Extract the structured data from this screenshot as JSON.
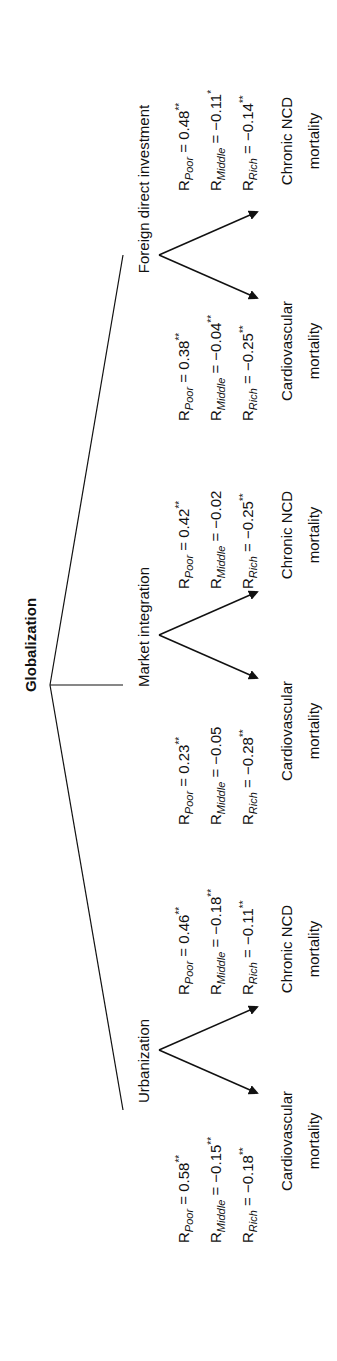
{
  "diagram": {
    "root": "Globalization",
    "branches": [
      {
        "label": "Urbanization",
        "outcomes": [
          {
            "label_line1": "Cardiovascular",
            "label_line2": "mortality",
            "r": [
              {
                "group": "Poor",
                "value": "0.58",
                "sig": "**"
              },
              {
                "group": "Middle",
                "value": "−0.15",
                "sig": "**"
              },
              {
                "group": "Rich",
                "value": "−0.18",
                "sig": "**"
              }
            ]
          },
          {
            "label_line1": "Chronic NCD",
            "label_line2": "mortality",
            "r": [
              {
                "group": "Poor",
                "value": "0.46",
                "sig": "**"
              },
              {
                "group": "Middle",
                "value": "−0.18",
                "sig": "**"
              },
              {
                "group": "Rich",
                "value": "−0.11",
                "sig": "**"
              }
            ]
          }
        ]
      },
      {
        "label": "Market integration",
        "outcomes": [
          {
            "label_line1": "Cardiovascular",
            "label_line2": "mortality",
            "r": [
              {
                "group": "Poor",
                "value": "0.23",
                "sig": "**"
              },
              {
                "group": "Middle",
                "value": "−0.05",
                "sig": ""
              },
              {
                "group": "Rich",
                "value": "−0.28",
                "sig": "**"
              }
            ]
          },
          {
            "label_line1": "Chronic NCD",
            "label_line2": "mortality",
            "r": [
              {
                "group": "Poor",
                "value": "0.42",
                "sig": "**"
              },
              {
                "group": "Middle",
                "value": "−0.02",
                "sig": ""
              },
              {
                "group": "Rich",
                "value": "−0.25",
                "sig": "**"
              }
            ]
          }
        ]
      },
      {
        "label": "Foreign direct investment",
        "outcomes": [
          {
            "label_line1": "Cardiovascular",
            "label_line2": "mortality",
            "r": [
              {
                "group": "Poor",
                "value": "0.38",
                "sig": "**"
              },
              {
                "group": "Middle",
                "value": "−0.04",
                "sig": "**"
              },
              {
                "group": "Rich",
                "value": "−0.25",
                "sig": "**"
              }
            ]
          },
          {
            "label_line1": "Chronic NCD",
            "label_line2": "mortality",
            "r": [
              {
                "group": "Poor",
                "value": "0.48",
                "sig": "**"
              },
              {
                "group": "Middle",
                "value": "−0.11",
                "sig": "*"
              },
              {
                "group": "Rich",
                "value": "−0.14",
                "sig": "**"
              }
            ]
          }
        ]
      }
    ],
    "r_prefix": "R",
    "equals": " = "
  }
}
